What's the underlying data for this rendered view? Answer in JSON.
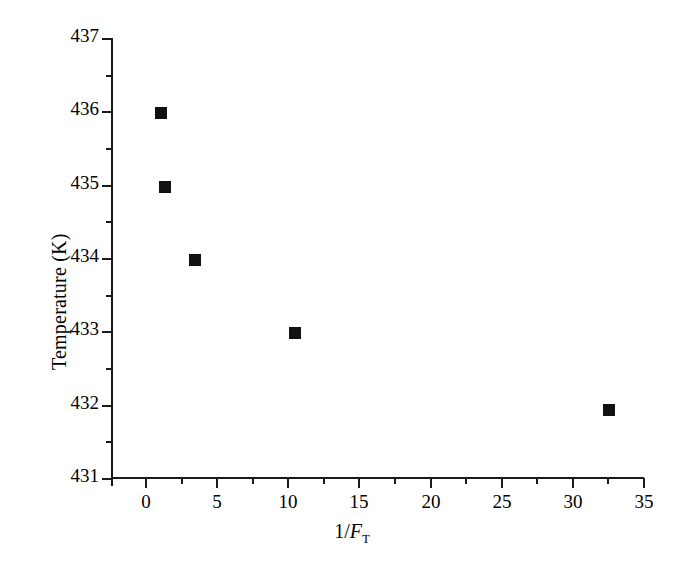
{
  "chart_data": {
    "type": "scatter",
    "title": "",
    "xlabel": "1/F_T",
    "xlabel_parts": {
      "prefix": "1/",
      "symbol": "F",
      "subscript": "T"
    },
    "ylabel": "Temperature (K)",
    "xlim": [
      -2.3,
      35.0
    ],
    "ylim": [
      431,
      437
    ],
    "xticks": [
      0,
      5,
      10,
      15,
      20,
      25,
      30,
      35
    ],
    "xtick_labels": [
      "0",
      "5",
      "10",
      "15",
      "20",
      "25",
      "30",
      "35"
    ],
    "yticks": [
      431,
      432,
      433,
      434,
      435,
      436,
      437
    ],
    "ytick_labels": [
      "431",
      "432",
      "433",
      "434",
      "435",
      "436",
      "437"
    ],
    "minor_ticks_per_interval": 1,
    "grid": false,
    "legend": null,
    "marker_style": "filled-square",
    "marker_color": "#111111",
    "series": [
      {
        "name": "Temperature vs 1/F_T",
        "points": [
          {
            "x": 1.0,
            "y": 436.0
          },
          {
            "x": 1.3,
            "y": 435.0
          },
          {
            "x": 3.4,
            "y": 434.0
          },
          {
            "x": 10.4,
            "y": 433.0
          },
          {
            "x": 32.5,
            "y": 431.95
          }
        ]
      }
    ]
  },
  "axes": {
    "y_axis_name": "temperature-axis",
    "x_axis_name": "inverse-ft-axis"
  }
}
